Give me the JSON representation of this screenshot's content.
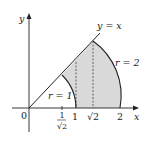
{
  "figure": {
    "axes": {
      "x_label": "x",
      "y_label": "y",
      "origin_label": "0"
    },
    "ticks": [
      {
        "name": "one-over-sqrt2",
        "num": "1",
        "den": "√2"
      },
      {
        "name": "one",
        "label": "1"
      },
      {
        "name": "sqrt2",
        "label": "√2"
      },
      {
        "name": "two",
        "label": "2"
      }
    ],
    "labels": {
      "line": "y = x",
      "inner_arc": "r = 1",
      "outer_arc": "r = 2"
    },
    "colors": {
      "shade": "#d9d9d9",
      "stroke": "#222222"
    }
  }
}
